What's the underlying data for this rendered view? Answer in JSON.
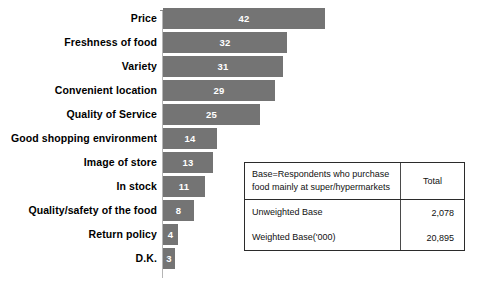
{
  "chart_data": {
    "type": "bar",
    "orientation": "horizontal",
    "title": "",
    "xlabel": "",
    "ylabel": "",
    "grid": false,
    "legend": false,
    "axis_visible": true,
    "xlim": [
      0,
      42
    ],
    "bar_color": "#747474",
    "value_label_color": "#ffffff",
    "categories": [
      "Price",
      "Freshness of food",
      "Variety",
      "Convenient location",
      "Quality of Service",
      "Good shopping environment",
      "Image of store",
      "In stock",
      "Quality/safety of the food",
      "Return policy",
      "D.K."
    ],
    "values": [
      42,
      32,
      31,
      29,
      25,
      14,
      13,
      11,
      8,
      4,
      3
    ]
  },
  "base_table": {
    "header": {
      "label_line1": "Base=Respondents who purchase",
      "label_line2": "food mainly at super/hypermarkets",
      "total": "Total"
    },
    "rows": [
      {
        "label": "Unweighted Base",
        "total": "2,078"
      },
      {
        "label": "Weighted Base('000)",
        "total": "20,895"
      }
    ]
  }
}
